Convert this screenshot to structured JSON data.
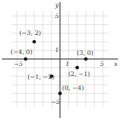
{
  "chart_data": {
    "type": "scatter",
    "title": "",
    "xlabel": "x",
    "ylabel": "y",
    "xlim": [
      -5.5,
      5.5
    ],
    "ylim": [
      -5.5,
      5.5
    ],
    "grid": true,
    "tick_labels": {
      "x": [
        {
          "value": -5,
          "label": "−5"
        },
        {
          "value": 1,
          "label": "1"
        },
        {
          "value": 5,
          "label": "5"
        }
      ],
      "y": [
        {
          "value": 5,
          "label": "5"
        },
        {
          "value": 1,
          "label": "1"
        },
        {
          "value": -5,
          "label": "−5"
        }
      ]
    },
    "points": [
      {
        "x": -3,
        "y": 2,
        "label": "(−3, 2)"
      },
      {
        "x": -4,
        "y": 0,
        "label": "(−4, 0)"
      },
      {
        "x": 3,
        "y": 0,
        "label": "(3, 0)"
      },
      {
        "x": 2,
        "y": -1,
        "label": "(2, −1)"
      },
      {
        "x": -1,
        "y": -2,
        "label": "(−1, −2)"
      },
      {
        "x": 0,
        "y": -4,
        "label": "(0, −4)"
      }
    ]
  },
  "colors": {
    "grid": "#d9d9d9",
    "axis": "#444444",
    "point": "#111111",
    "text": "#333333"
  }
}
